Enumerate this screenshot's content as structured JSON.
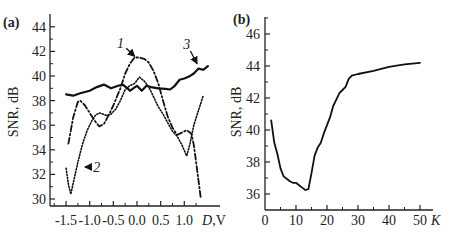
{
  "chart_data": [
    {
      "panel": "(a)",
      "type": "line",
      "title": "",
      "xlabel": "D, V",
      "ylabel": "SNR, dB",
      "xlim": [
        -1.7,
        1.65
      ],
      "ylim": [
        29.7,
        45
      ],
      "xticks": [
        -1.5,
        -1.0,
        -0.5,
        0.0,
        0.5,
        1.0
      ],
      "xtick_labels": [
        "-1.5",
        "-1.0",
        "-0.5",
        "0.0",
        "0.5",
        "1.0"
      ],
      "yticks": [
        30,
        32,
        34,
        36,
        38,
        40,
        42,
        44
      ],
      "ytick_labels": [
        "30",
        "32",
        "34",
        "36",
        "38",
        "40",
        "42",
        "44"
      ],
      "grid": false,
      "legend": "curve numbers with arrows",
      "series": [
        {
          "name": "1",
          "style": "dash-dot",
          "x": [
            -1.45,
            -1.35,
            -1.25,
            -1.2,
            -1.1,
            -1.0,
            -0.9,
            -0.8,
            -0.7,
            -0.6,
            -0.5,
            -0.35,
            -0.25,
            -0.15,
            -0.05,
            0.05,
            0.15,
            0.25,
            0.35,
            0.45,
            0.55,
            0.65,
            0.75,
            0.85,
            0.95,
            1.05,
            1.15,
            1.2,
            1.25,
            1.3,
            1.35
          ],
          "y": [
            34.5,
            36.6,
            37.9,
            38.0,
            37.6,
            37.0,
            36.4,
            35.9,
            36.1,
            36.8,
            37.6,
            39.0,
            40.2,
            41.0,
            41.5,
            41.5,
            41.4,
            41.1,
            40.4,
            39.4,
            38.0,
            36.7,
            35.8,
            35.2,
            35.4,
            35.6,
            35.3,
            34.4,
            33.0,
            31.5,
            30.0
          ]
        },
        {
          "name": "2",
          "style": "dotted",
          "x": [
            -1.5,
            -1.45,
            -1.4,
            -1.32,
            -1.25,
            -1.15,
            -1.05,
            -0.95,
            -0.88,
            -0.8,
            -0.72,
            -0.65,
            -0.55,
            -0.45,
            -0.35,
            -0.25,
            -0.15,
            -0.05,
            0.05,
            0.15,
            0.25,
            0.35,
            0.45,
            0.55,
            0.65,
            0.75,
            0.85,
            0.95,
            1.05,
            1.12,
            1.2,
            1.3,
            1.4
          ],
          "y": [
            32.5,
            31.2,
            30.4,
            31.8,
            33.0,
            34.5,
            35.6,
            36.4,
            36.8,
            37.0,
            36.9,
            36.8,
            36.9,
            37.3,
            38.0,
            38.9,
            39.2,
            39.4,
            39.9,
            39.6,
            39.1,
            38.3,
            37.5,
            36.9,
            36.2,
            35.5,
            35.1,
            34.4,
            33.5,
            34.5,
            36.0,
            37.2,
            38.4
          ]
        },
        {
          "name": "3",
          "style": "solid",
          "x": [
            -1.5,
            -1.35,
            -1.2,
            -1.0,
            -0.85,
            -0.7,
            -0.55,
            -0.4,
            -0.3,
            -0.2,
            -0.15,
            -0.08,
            0.0,
            0.05,
            0.1,
            0.2,
            0.3,
            0.45,
            0.6,
            0.7,
            0.8,
            0.9,
            1.0,
            1.1,
            1.2,
            1.3,
            1.4,
            1.5
          ],
          "y": [
            38.5,
            38.4,
            38.6,
            38.8,
            39.1,
            39.3,
            39.0,
            39.2,
            39.3,
            39.0,
            38.8,
            39.0,
            39.2,
            39.0,
            38.8,
            39.2,
            39.1,
            39.0,
            38.95,
            38.9,
            39.2,
            39.7,
            39.8,
            39.95,
            40.2,
            40.6,
            40.5,
            40.8
          ]
        }
      ],
      "annotations": [
        {
          "label": "1",
          "text_pos": [
            -0.35,
            42.3
          ],
          "arrow_to": [
            -0.05,
            41.6
          ]
        },
        {
          "label": "2",
          "text_pos": [
            -0.85,
            32.2
          ],
          "arrow_to": [
            -1.1,
            32.6
          ]
        },
        {
          "label": "3",
          "text_pos": [
            1.05,
            42.2
          ],
          "arrow_to": [
            1.27,
            41.0
          ]
        }
      ]
    },
    {
      "panel": "(b)",
      "type": "line",
      "title": "",
      "xlabel": "K",
      "ylabel": "SNR, dB",
      "xlim": [
        0,
        55
      ],
      "ylim": [
        35,
        47
      ],
      "xticks": [
        0,
        10,
        20,
        30,
        40,
        50
      ],
      "xtick_labels": [
        "0",
        "10",
        "20",
        "30",
        "40",
        "50"
      ],
      "yticks": [
        36,
        38,
        40,
        42,
        44,
        46
      ],
      "ytick_labels": [
        "36",
        "38",
        "40",
        "42",
        "44",
        "46"
      ],
      "grid": false,
      "series": [
        {
          "name": "SNR vs K",
          "style": "solid",
          "x": [
            2,
            3,
            4,
            5,
            6,
            7,
            8,
            9,
            10,
            11,
            12,
            13,
            14,
            15,
            16,
            17,
            18,
            19,
            20,
            21,
            22,
            23,
            24,
            25,
            26,
            27,
            28,
            30,
            35,
            40,
            45,
            50
          ],
          "y": [
            40.6,
            39.2,
            38.5,
            37.6,
            37.1,
            36.95,
            36.8,
            36.7,
            36.7,
            36.55,
            36.4,
            36.25,
            36.3,
            37.3,
            38.4,
            38.9,
            39.2,
            39.8,
            40.3,
            40.8,
            41.5,
            41.9,
            42.3,
            42.5,
            42.7,
            43.2,
            43.4,
            43.5,
            43.7,
            43.95,
            44.1,
            44.2
          ]
        }
      ]
    }
  ],
  "labels": {
    "panel_a": "(a)",
    "panel_b": "(b)",
    "ylabel_a": "SNR, dB",
    "ylabel_b": "SNR, dB",
    "xlabel_a_var": "D",
    "xlabel_a_unit": ",V",
    "xlabel_b": "K",
    "curve1": "1",
    "curve2": "2",
    "curve3": "3"
  }
}
